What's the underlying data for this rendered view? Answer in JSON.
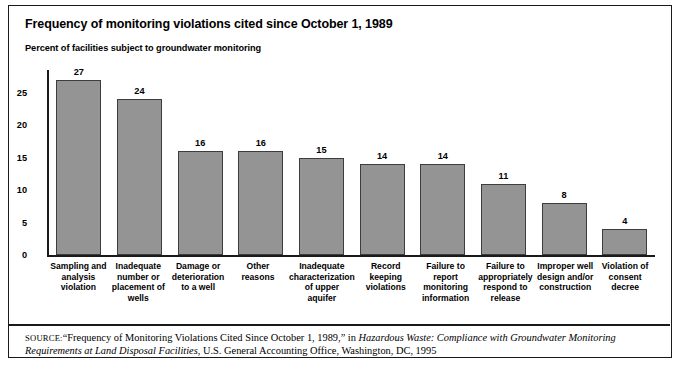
{
  "figure": {
    "title": "Frequency of monitoring violations cited since October 1, 1989",
    "subtitle": "Percent of facilities subject to groundwater monitoring"
  },
  "source_note": {
    "label": "SOURCE:",
    "text_1": "“Frequency of Monitoring Violations Cited Since October 1, 1989,” in ",
    "italic_1": "Hazardous Waste: Compliance with Groundwater Monitoring Requirements at Land Disposal Facilities",
    "text_2": ", U.S. General Accounting Office, Washington, DC, 1995"
  },
  "chart_data": {
    "type": "bar",
    "title": "Frequency of monitoring violations cited since October 1, 1989",
    "subtitle": "Percent of facilities subject to groundwater monitoring",
    "xlabel": "",
    "ylabel": "Percent of facilities subject to groundwater monitoring",
    "ylim": [
      0,
      28.5
    ],
    "yticks": [
      0,
      5,
      10,
      15,
      20,
      25
    ],
    "ytick_labels": [
      "0",
      "5",
      "10",
      "15",
      "20",
      "25"
    ],
    "grid": false,
    "legend": false,
    "bar_color": "#949494",
    "bar_edge_color": "#3d3d3d",
    "categories": [
      "Sampling and analysis violation",
      "Inadequate number or placement of wells",
      "Damage or deterioration to a well",
      "Other reasons",
      "Inadequate characterization of upper aquifer",
      "Record keeping violations",
      "Failure to report monitoring information",
      "Failure to appropriately respond to release",
      "Improper well design and/or construction",
      "Violation of consent decree"
    ],
    "category_lines": [
      [
        "Sampling and",
        "analysis",
        "violation"
      ],
      [
        "Inadequate",
        "number or",
        "placement of",
        "wells"
      ],
      [
        "Damage or",
        "deterioration",
        "to a well"
      ],
      [
        "Other reasons"
      ],
      [
        "Inadequate",
        "characterization",
        "of upper",
        "aquifer"
      ],
      [
        "Record",
        "keeping",
        "violations"
      ],
      [
        "Failure to",
        "report",
        "monitoring",
        "information"
      ],
      [
        "Failure to",
        "appropriately",
        "respond to",
        "release"
      ],
      [
        "Improper well",
        "design and/or",
        "construction"
      ],
      [
        "Violation of",
        "consent",
        "decree"
      ]
    ],
    "values": [
      27,
      24,
      16,
      16,
      15,
      14,
      14,
      11,
      8,
      4
    ],
    "value_labels": [
      "27",
      "24",
      "16",
      "16",
      "15",
      "14",
      "14",
      "11",
      "8",
      "4"
    ]
  }
}
